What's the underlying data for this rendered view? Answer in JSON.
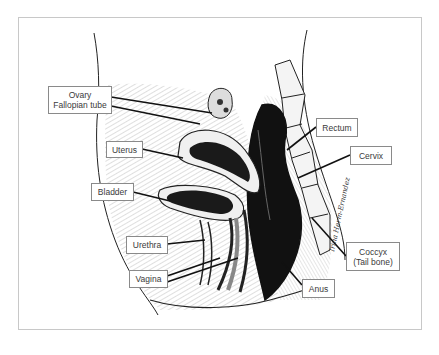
{
  "diagram": {
    "title": "",
    "signature": "Irina Herm-Ernandez",
    "colors": {
      "ink": "#1a1a1a",
      "frame": "#c8c8c8",
      "label_border": "#8a8a8a",
      "label_text": "#3a3a3a"
    },
    "labels": [
      {
        "id": "ovary",
        "lines": [
          "Ovary",
          "Fallopian tube"
        ]
      },
      {
        "id": "uterus",
        "lines": [
          "Uterus"
        ]
      },
      {
        "id": "bladder",
        "lines": [
          "Bladder"
        ]
      },
      {
        "id": "urethra",
        "lines": [
          "Urethra"
        ]
      },
      {
        "id": "vagina",
        "lines": [
          "Vagina"
        ]
      },
      {
        "id": "rectum",
        "lines": [
          "Rectum"
        ]
      },
      {
        "id": "cervix",
        "lines": [
          "Cervix"
        ]
      },
      {
        "id": "coccyx",
        "lines": [
          "Coccyx",
          "(Tail bone)"
        ]
      },
      {
        "id": "anus",
        "lines": [
          "Anus"
        ]
      }
    ]
  }
}
